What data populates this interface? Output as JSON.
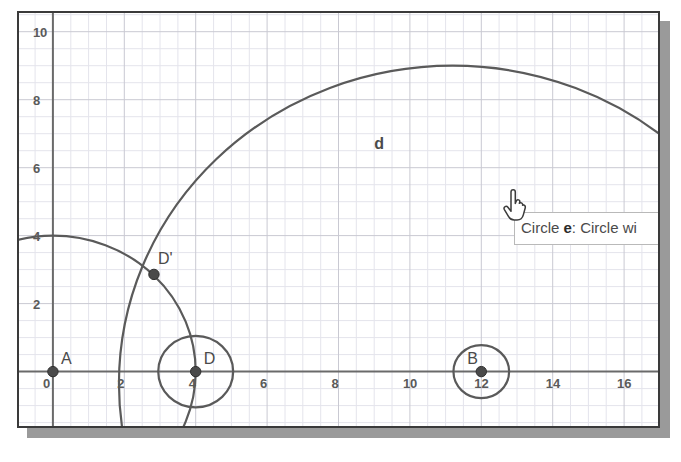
{
  "app": {
    "title": "Dynamic Geometry Applet",
    "background": "#ffffff",
    "panel_border_color": "#3a3a3a",
    "shadow_color": "#9a9a9a"
  },
  "tooltip": {
    "prefix": "Circle ",
    "object_name": "e",
    "suffix": ": Circle wi",
    "truncated": true,
    "full_visible_text": "Circle e: Circle wi"
  },
  "cursor": {
    "type": "pointing-hand",
    "x": 485,
    "y": 180
  },
  "chart_data": {
    "type": "scatter",
    "title": "",
    "xlabel": "",
    "ylabel": "",
    "xlim": [
      -0.95,
      16.95
    ],
    "ylim": [
      -1.6,
      10.55
    ],
    "grid": true,
    "grid_minor": true,
    "grid_color": "#c9c9d2",
    "grid_minor_color": "#e4e4ec",
    "axis_color": "#6a6a6a",
    "curve_color": "#5a5a5a",
    "point_color": "#4a4a4a",
    "xticks": [
      0,
      2,
      4,
      6,
      8,
      10,
      12,
      14,
      16
    ],
    "xtick_labels": [
      "0",
      "2",
      "4",
      "6",
      "8",
      "10",
      "12",
      "14",
      "16"
    ],
    "yticks": [
      2,
      4,
      6,
      8,
      10
    ],
    "ytick_labels": [
      "2",
      "4",
      "6",
      "8",
      "10"
    ],
    "points": [
      {
        "name": "A",
        "label": "A",
        "x": 0,
        "y": 0,
        "label_dx": 8,
        "label_dy": -8
      },
      {
        "name": "D",
        "label": "D",
        "x": 4,
        "y": 0,
        "label_dx": 8,
        "label_dy": -8
      },
      {
        "name": "B",
        "label": "B",
        "x": 12,
        "y": 0,
        "label_dx": -14,
        "label_dy": -8
      },
      {
        "name": "Dp",
        "label": "D'",
        "x": 2.83,
        "y": 2.86,
        "label_dx": 4,
        "label_dy": -10
      }
    ],
    "circles": [
      {
        "name": "d",
        "label": "d",
        "label_x": 9.0,
        "label_y": 6.55,
        "cx": 11.2,
        "cy": -0.35,
        "r": 9.35
      },
      {
        "name": "e",
        "label": "",
        "label_x": null,
        "label_y": null,
        "cx": 12.0,
        "cy": 0.0,
        "r": 0.78
      },
      {
        "name": "c",
        "label": "",
        "label_x": null,
        "label_y": null,
        "cx": 0.0,
        "cy": 0.0,
        "r": 4.0
      },
      {
        "name": "f",
        "label": "",
        "label_x": null,
        "label_y": null,
        "cx": 4.0,
        "cy": 0.0,
        "r": 1.05
      }
    ]
  }
}
